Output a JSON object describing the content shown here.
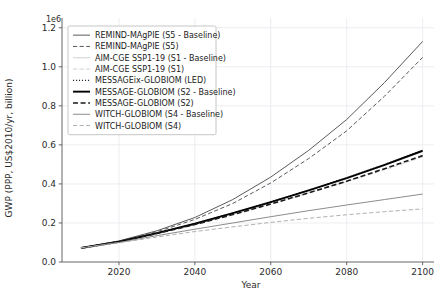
{
  "chart_data": {
    "type": "line",
    "title": "",
    "xlabel": "Year",
    "ylabel": "GWP (PPP, US$2010/yr, billion)",
    "y_offset_text": "1e6",
    "y_offset_value": 1000000,
    "xlim": [
      2005,
      2103
    ],
    "ylim": [
      0.0,
      1.25
    ],
    "xticks": [
      2020,
      2040,
      2060,
      2080,
      2100
    ],
    "yticks": [
      0.0,
      0.2,
      0.4,
      0.6,
      0.8,
      1.0,
      1.2
    ],
    "xtick_labels": [
      "2020",
      "2040",
      "2060",
      "2080",
      "2100"
    ],
    "ytick_labels": [
      "0.0",
      "0.2",
      "0.4",
      "0.6",
      "0.8",
      "1.0",
      "1.2"
    ],
    "grid": true,
    "legend_position": "upper left",
    "x": [
      2010,
      2020,
      2030,
      2040,
      2050,
      2060,
      2070,
      2080,
      2090,
      2100
    ],
    "series": [
      {
        "name": "REMIND-MAgPIE (S5 - Baseline)",
        "label": "REMIND-MAgPIE (S5 - Baseline)",
        "style": "solid",
        "color": "#5a5a5a",
        "width": 1.0,
        "values": [
          0.072,
          0.108,
          0.16,
          0.228,
          0.32,
          0.435,
          0.572,
          0.73,
          0.92,
          1.13
        ]
      },
      {
        "name": "REMIND-MAgPIE (S5)",
        "label": "REMIND-MAgPIE (S5)",
        "style": "dashed",
        "color": "#5a5a5a",
        "width": 1.0,
        "values": [
          0.072,
          0.106,
          0.155,
          0.218,
          0.3,
          0.405,
          0.53,
          0.672,
          0.85,
          1.048
        ]
      },
      {
        "name": "AIM-CGE SSP1-19 (S1 - Baseline)",
        "label": "AIM-CGE SSP1-19 (S1 - Baseline)",
        "style": "solid",
        "color": "#d2d2d2",
        "width": 1.0,
        "values": [
          0.072,
          0.105,
          0.15,
          0.198,
          0.252,
          0.31,
          0.368,
          0.43,
          0.495,
          0.565
        ]
      },
      {
        "name": "AIM-CGE SSP1-19 (S1)",
        "label": "AIM-CGE SSP1-19 (S1)",
        "style": "dashed",
        "color": "#d2d2d2",
        "width": 1.0,
        "values": [
          0.072,
          0.104,
          0.147,
          0.193,
          0.244,
          0.298,
          0.354,
          0.412,
          0.472,
          0.538
        ]
      },
      {
        "name": "MESSAGEix-GLOBIOM (LED)",
        "label": "MESSAGEix-GLOBIOM (LED)",
        "style": "dotted",
        "color": "#2b2b2b",
        "width": 1.1,
        "values": [
          0.072,
          0.104,
          0.148,
          0.196,
          0.25,
          0.308,
          0.368,
          0.432,
          0.5,
          0.572
        ]
      },
      {
        "name": "MESSAGE-GLOBIOM (S2 - Baseline)",
        "label": "MESSAGE-GLOBIOM (S2 - Baseline)",
        "style": "solid",
        "color": "#000000",
        "width": 1.9,
        "values": [
          0.072,
          0.104,
          0.148,
          0.196,
          0.25,
          0.307,
          0.367,
          0.43,
          0.498,
          0.57
        ]
      },
      {
        "name": "MESSAGE-GLOBIOM (S2)",
        "label": "MESSAGE-GLOBIOM (S2)",
        "style": "dashed",
        "color": "#1a1a1a",
        "width": 1.6,
        "values": [
          0.072,
          0.103,
          0.146,
          0.192,
          0.243,
          0.297,
          0.354,
          0.414,
          0.478,
          0.545
        ]
      },
      {
        "name": "WITCH-GLOBIOM (S4 - Baseline)",
        "label": "WITCH-GLOBIOM (S4 - Baseline)",
        "style": "solid",
        "color": "#8c8c8c",
        "width": 1.0,
        "values": [
          0.072,
          0.1,
          0.135,
          0.168,
          0.2,
          0.232,
          0.263,
          0.292,
          0.32,
          0.348
        ]
      },
      {
        "name": "WITCH-GLOBIOM (S4)",
        "label": "WITCH-GLOBIOM (S4)",
        "style": "dashed",
        "color": "#b0b0b0",
        "width": 1.0,
        "values": [
          0.072,
          0.098,
          0.128,
          0.156,
          0.18,
          0.203,
          0.224,
          0.242,
          0.258,
          0.272
        ]
      }
    ]
  }
}
